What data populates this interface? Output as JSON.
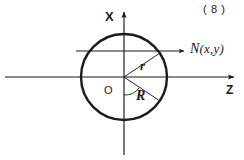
{
  "figure": {
    "caption_number": "( 8 )",
    "background_color": "#ffffff",
    "ink_color": "#1a1a1a",
    "width": 244,
    "height": 160
  },
  "axes": {
    "vertical": {
      "label": "X",
      "x": 124,
      "y_top": 8,
      "y_bottom": 155,
      "arrow_at": "top"
    },
    "horizontal": {
      "label": "Z",
      "y": 77,
      "x_left": 5,
      "x_right": 238,
      "arrow_at": "right"
    }
  },
  "circle": {
    "center_x": 124,
    "center_y": 77,
    "radius": 43,
    "stroke_width": 2.4
  },
  "origin": {
    "label": "O",
    "x": 124,
    "y": 77
  },
  "radii": {
    "small": {
      "label": "r",
      "angle_deg": 34,
      "end_x": 160,
      "end_y": 53
    },
    "large": {
      "label": "R",
      "angle_deg": -33,
      "end_x": 160,
      "end_y": 101
    }
  },
  "normal_vector": {
    "label_n": "N",
    "label_args": "(x,y)",
    "label_full": "N(x,y)",
    "line_y": 51,
    "line_x_start": 76,
    "line_x_end": 188,
    "arrow_at": "right"
  }
}
